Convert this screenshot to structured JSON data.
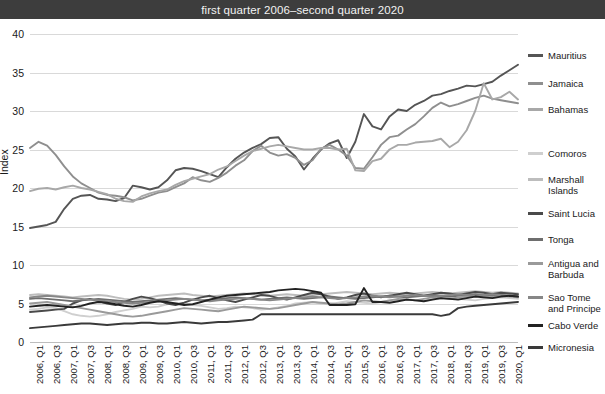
{
  "header": {
    "title": "first quarter 2006–second quarter 2020"
  },
  "axis": {
    "ylabel": "Index",
    "yticks": [
      "0",
      "5",
      "10",
      "15",
      "20",
      "25",
      "30",
      "35",
      "40"
    ],
    "xticks": [
      "2006, Q1",
      "2006, Q3",
      "2007, Q1",
      "2007, Q3",
      "2008, Q1",
      "2008, Q3",
      "2009, Q1",
      "2009, Q3",
      "2010, Q1",
      "2010, Q3",
      "2011, Q1",
      "2011, Q3",
      "2012, Q1",
      "2012, Q3",
      "2013, Q1",
      "2013, Q3",
      "2014, Q1",
      "2014, Q3",
      "2015, Q1",
      "2015, Q3",
      "2016, Q1",
      "2016, Q3",
      "2017, Q1",
      "2017, Q3",
      "2018, Q1",
      "2018, Q3",
      "2019, Q1",
      "2019, Q3",
      "2020, Q1"
    ]
  },
  "legend": {
    "items": [
      {
        "label": "Mauritius",
        "color": "#555555"
      },
      {
        "label": "Jamaica",
        "color": "#8f8f8f"
      },
      {
        "label": "Bahamas",
        "color": "#a8a8a8"
      },
      {
        "label": "Comoros",
        "color": "#cfcfcf"
      },
      {
        "label": "Marshall\nIslands",
        "color": "#bdbdbd"
      },
      {
        "label": "Saint Lucia",
        "color": "#4a4a4a"
      },
      {
        "label": "Tonga",
        "color": "#6e6e6e"
      },
      {
        "label": "Antigua and\nBarbuda",
        "color": "#9a9a9a"
      },
      {
        "label": "Sao Tome\nand Principe",
        "color": "#878787"
      },
      {
        "label": "Cabo Verde",
        "color": "#222222"
      },
      {
        "label": "Micronesia",
        "color": "#3a3a3a"
      }
    ]
  },
  "chart_data": {
    "type": "line",
    "title": "first quarter 2006–second quarter 2020",
    "xlabel": "",
    "ylabel": "Index",
    "ylim": [
      0,
      40
    ],
    "ytick_step": 5,
    "grid": true,
    "legend_position": "right",
    "x": [
      "2006, Q1",
      "2006, Q2",
      "2006, Q3",
      "2006, Q4",
      "2007, Q1",
      "2007, Q2",
      "2007, Q3",
      "2007, Q4",
      "2008, Q1",
      "2008, Q2",
      "2008, Q3",
      "2008, Q4",
      "2009, Q1",
      "2009, Q2",
      "2009, Q3",
      "2009, Q4",
      "2010, Q1",
      "2010, Q2",
      "2010, Q3",
      "2010, Q4",
      "2011, Q1",
      "2011, Q2",
      "2011, Q3",
      "2011, Q4",
      "2012, Q1",
      "2012, Q2",
      "2012, Q3",
      "2012, Q4",
      "2013, Q1",
      "2013, Q2",
      "2013, Q3",
      "2013, Q4",
      "2014, Q1",
      "2014, Q2",
      "2014, Q3",
      "2014, Q4",
      "2015, Q1",
      "2015, Q2",
      "2015, Q3",
      "2015, Q4",
      "2016, Q1",
      "2016, Q2",
      "2016, Q3",
      "2016, Q4",
      "2017, Q1",
      "2017, Q2",
      "2017, Q3",
      "2017, Q4",
      "2018, Q1",
      "2018, Q2",
      "2018, Q3",
      "2018, Q4",
      "2019, Q1",
      "2019, Q2",
      "2019, Q3",
      "2019, Q4",
      "2020, Q1",
      "2020, Q2"
    ],
    "series": [
      {
        "name": "Mauritius",
        "color": "#555555",
        "values": [
          14.8,
          15.0,
          15.2,
          15.6,
          17.3,
          18.6,
          19.0,
          19.1,
          18.6,
          18.5,
          18.3,
          18.7,
          20.3,
          20.1,
          19.8,
          20.1,
          21.0,
          22.3,
          22.6,
          22.5,
          22.2,
          21.8,
          21.4,
          22.7,
          23.8,
          24.6,
          25.2,
          25.7,
          26.5,
          26.6,
          25.1,
          24.1,
          22.4,
          23.8,
          25.0,
          25.8,
          26.2,
          23.9,
          26.0,
          29.6,
          28.0,
          27.6,
          29.3,
          30.2,
          30.0,
          30.8,
          31.3,
          32.0,
          32.2,
          32.6,
          32.9,
          33.3,
          33.2,
          33.5,
          33.8,
          34.6,
          35.3,
          36.0
        ]
      },
      {
        "name": "Jamaica",
        "color": "#8f8f8f",
        "values": [
          25.2,
          26.0,
          25.5,
          24.3,
          22.8,
          21.5,
          20.6,
          20.0,
          19.4,
          19.1,
          19.0,
          18.8,
          18.4,
          18.6,
          19.0,
          19.4,
          19.6,
          20.1,
          20.6,
          21.4,
          21.0,
          20.8,
          21.3,
          22.0,
          22.9,
          23.6,
          24.8,
          25.5,
          24.6,
          24.2,
          24.4,
          23.9,
          23.0,
          23.6,
          25.1,
          25.6,
          25.0,
          24.2,
          22.6,
          22.5,
          24.0,
          25.6,
          26.6,
          26.8,
          27.6,
          28.3,
          29.3,
          30.4,
          31.1,
          30.6,
          30.9,
          31.3,
          31.7,
          32.0,
          31.6,
          31.4,
          31.2,
          31.0
        ]
      },
      {
        "name": "Bahamas",
        "color": "#a8a8a8",
        "values": [
          19.6,
          19.9,
          20.0,
          19.8,
          20.1,
          20.3,
          20.0,
          19.8,
          19.5,
          19.2,
          18.6,
          18.3,
          18.2,
          18.9,
          19.3,
          19.6,
          19.8,
          20.4,
          20.9,
          21.2,
          21.5,
          21.8,
          22.4,
          22.8,
          23.5,
          24.2,
          24.8,
          25.1,
          25.4,
          25.6,
          25.4,
          25.2,
          25.0,
          25.0,
          25.2,
          25.2,
          25.0,
          25.1,
          22.3,
          22.2,
          23.5,
          23.8,
          25.0,
          25.6,
          25.6,
          25.9,
          26.0,
          26.1,
          26.4,
          25.3,
          26.0,
          27.5,
          30.0,
          33.6,
          31.5,
          31.8,
          32.5,
          31.5
        ]
      },
      {
        "name": "Comoros",
        "color": "#cfcfcf",
        "values": [
          4.2,
          4.3,
          4.5,
          4.4,
          4.0,
          3.6,
          3.4,
          3.3,
          3.4,
          3.6,
          3.9,
          4.1,
          4.3,
          4.6,
          4.5,
          4.6,
          4.9,
          5.1,
          5.0,
          4.8,
          4.7,
          4.5,
          4.3,
          4.4,
          4.6,
          4.5,
          4.4,
          4.2,
          4.3,
          4.5,
          4.7,
          5.0,
          5.1,
          5.2,
          5.0,
          4.9,
          5.1,
          5.3,
          5.2,
          5.1,
          5.0,
          5.2,
          5.4,
          5.5,
          5.6,
          5.4,
          5.3,
          5.5,
          5.6,
          5.7,
          5.6,
          5.5,
          5.4,
          5.6,
          5.7,
          5.8,
          5.7,
          5.6
        ]
      },
      {
        "name": "Marshall Islands",
        "color": "#bdbdbd",
        "values": [
          6.1,
          6.2,
          6.1,
          6.0,
          5.9,
          5.8,
          5.9,
          6.0,
          6.1,
          6.0,
          5.8,
          5.6,
          5.5,
          5.6,
          5.8,
          6.0,
          6.1,
          6.2,
          6.3,
          6.1,
          6.0,
          5.9,
          6.0,
          6.1,
          6.2,
          6.3,
          6.2,
          6.1,
          6.0,
          6.1,
          6.2,
          6.1,
          6.0,
          6.1,
          6.2,
          6.3,
          6.4,
          6.5,
          6.4,
          6.3,
          6.2,
          6.3,
          6.4,
          6.3,
          6.2,
          6.3,
          6.4,
          6.5,
          6.4,
          6.3,
          6.4,
          6.5,
          6.6,
          6.5,
          6.4,
          6.5,
          6.4,
          6.3
        ]
      },
      {
        "name": "Saint Lucia",
        "color": "#4a4a4a",
        "values": [
          3.9,
          4.0,
          4.1,
          4.2,
          4.3,
          5.0,
          5.4,
          5.6,
          5.3,
          5.0,
          4.8,
          5.2,
          5.6,
          5.9,
          5.7,
          5.4,
          5.0,
          4.8,
          5.1,
          5.5,
          5.8,
          6.0,
          5.7,
          5.4,
          5.2,
          5.5,
          5.8,
          6.1,
          6.0,
          5.7,
          5.5,
          5.8,
          6.1,
          6.4,
          6.2,
          5.9,
          5.6,
          5.8,
          6.1,
          6.3,
          6.0,
          5.8,
          6.0,
          6.2,
          6.4,
          6.2,
          6.0,
          6.2,
          6.4,
          6.3,
          6.1,
          6.3,
          6.5,
          6.4,
          6.2,
          6.4,
          6.3,
          6.2
        ]
      },
      {
        "name": "Tonga",
        "color": "#6e6e6e",
        "values": [
          5.6,
          5.7,
          5.6,
          5.5,
          5.4,
          5.3,
          5.4,
          5.5,
          5.6,
          5.5,
          5.4,
          5.3,
          5.2,
          5.3,
          5.4,
          5.5,
          5.6,
          5.7,
          5.6,
          5.5,
          5.4,
          5.5,
          5.6,
          5.7,
          5.8,
          5.7,
          5.6,
          5.5,
          5.6,
          5.7,
          5.8,
          5.7,
          5.6,
          5.7,
          5.8,
          5.9,
          5.8,
          5.7,
          5.6,
          5.7,
          5.8,
          5.9,
          6.0,
          5.9,
          5.8,
          5.9,
          6.0,
          6.1,
          6.0,
          5.9,
          6.0,
          6.1,
          6.2,
          6.1,
          6.0,
          6.1,
          6.0,
          5.9
        ]
      },
      {
        "name": "Antigua and Barbuda",
        "color": "#9a9a9a",
        "values": [
          5.0,
          5.1,
          5.2,
          5.0,
          4.8,
          4.6,
          4.4,
          4.2,
          4.0,
          3.8,
          3.6,
          3.4,
          3.3,
          3.4,
          3.6,
          3.8,
          4.0,
          4.2,
          4.4,
          4.3,
          4.2,
          4.1,
          4.0,
          4.2,
          4.4,
          4.6,
          4.5,
          4.4,
          4.3,
          4.4,
          4.6,
          4.8,
          5.0,
          5.2,
          5.1,
          5.0,
          4.9,
          5.0,
          5.2,
          5.4,
          5.3,
          5.2,
          5.4,
          5.6,
          5.5,
          5.4,
          5.6,
          5.8,
          5.7,
          5.6,
          5.8,
          5.9,
          6.0,
          5.9,
          5.8,
          6.0,
          5.9,
          5.8
        ]
      },
      {
        "name": "Sao Tome and Principe",
        "color": "#878787",
        "values": [
          5.8,
          5.9,
          6.0,
          5.9,
          5.8,
          5.7,
          5.6,
          5.5,
          5.4,
          5.3,
          5.2,
          5.1,
          5.0,
          5.1,
          5.2,
          5.3,
          5.4,
          5.5,
          5.6,
          5.5,
          5.4,
          5.3,
          5.4,
          5.5,
          5.6,
          5.7,
          5.6,
          5.5,
          5.4,
          5.5,
          5.6,
          5.7,
          5.8,
          5.9,
          5.8,
          5.7,
          5.6,
          5.7,
          5.8,
          5.9,
          6.0,
          5.9,
          5.8,
          5.9,
          6.0,
          6.1,
          6.0,
          5.9,
          6.0,
          6.1,
          6.2,
          6.1,
          6.0,
          6.1,
          6.2,
          6.1,
          6.0,
          5.9
        ]
      },
      {
        "name": "Cabo Verde",
        "color": "#222222",
        "values": [
          4.6,
          4.7,
          4.8,
          4.7,
          4.6,
          4.5,
          4.7,
          5.0,
          5.2,
          5.1,
          4.9,
          4.7,
          4.6,
          4.8,
          5.1,
          5.3,
          5.2,
          5.0,
          4.8,
          4.9,
          5.2,
          5.5,
          5.8,
          6.0,
          6.1,
          6.2,
          6.3,
          6.4,
          6.5,
          6.7,
          6.8,
          6.9,
          6.8,
          6.6,
          6.4,
          4.8,
          4.8,
          4.8,
          4.9,
          7.0,
          5.2,
          5.2,
          5.1,
          5.3,
          5.5,
          5.4,
          5.3,
          5.5,
          5.7,
          5.6,
          5.5,
          5.7,
          5.9,
          5.8,
          5.7,
          5.9,
          6.0,
          5.9
        ]
      },
      {
        "name": "Micronesia",
        "color": "#3a3a3a",
        "values": [
          1.8,
          1.9,
          2.0,
          2.1,
          2.2,
          2.3,
          2.4,
          2.4,
          2.3,
          2.2,
          2.3,
          2.4,
          2.4,
          2.5,
          2.5,
          2.4,
          2.4,
          2.5,
          2.6,
          2.5,
          2.4,
          2.5,
          2.6,
          2.6,
          2.7,
          2.8,
          2.9,
          3.6,
          3.6,
          3.6,
          3.6,
          3.6,
          3.6,
          3.6,
          3.6,
          3.6,
          3.6,
          3.6,
          3.6,
          3.6,
          3.6,
          3.6,
          3.6,
          3.6,
          3.6,
          3.6,
          3.6,
          3.6,
          3.4,
          3.6,
          4.4,
          4.6,
          4.7,
          4.8,
          4.9,
          5.0,
          5.1,
          5.2
        ]
      }
    ]
  }
}
